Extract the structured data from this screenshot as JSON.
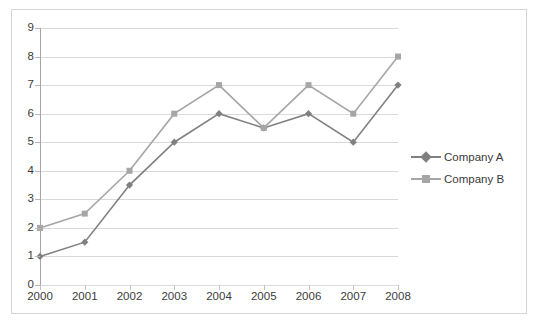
{
  "chart_data": {
    "type": "line",
    "title": "",
    "xlabel": "",
    "ylabel": "",
    "categories": [
      "2000",
      "2001",
      "2002",
      "2003",
      "2004",
      "2005",
      "2006",
      "2007",
      "2008"
    ],
    "x": [
      2000,
      2001,
      2002,
      2003,
      2004,
      2005,
      2006,
      2007,
      2008
    ],
    "series": [
      {
        "name": "Company A",
        "marker": "diamond",
        "color": "#808080",
        "values": [
          1,
          1.5,
          3.5,
          5,
          6,
          5.5,
          6,
          5,
          7
        ]
      },
      {
        "name": "Company B",
        "marker": "square",
        "color": "#a6a6a6",
        "values": [
          2,
          2.5,
          4,
          6,
          7,
          5.5,
          7,
          6,
          8
        ]
      }
    ],
    "ylim": [
      0,
      9
    ],
    "yticks": [
      0,
      1,
      2,
      3,
      4,
      5,
      6,
      7,
      8,
      9
    ],
    "ytick_labels": [
      "0",
      "1",
      "2",
      "3",
      "4",
      "5",
      "6",
      "7",
      "8",
      "9"
    ],
    "grid": "horizontal",
    "legend_position": "right",
    "gridline_color": "#d9d9d9",
    "axis_color": "#a6a6a6",
    "background": "#ffffff",
    "border_color": "#d5d5d5",
    "text_color": "#3b3b3b"
  },
  "legend": {
    "entries": [
      {
        "label": "Company A"
      },
      {
        "label": "Company B"
      }
    ]
  }
}
